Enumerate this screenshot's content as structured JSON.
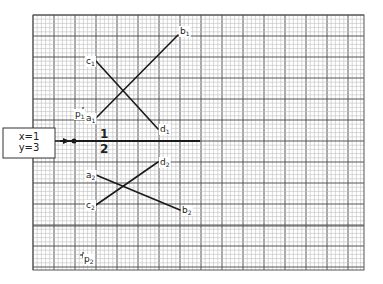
{
  "diagram": {
    "grid": {
      "left": 33,
      "top": 15,
      "right": 364,
      "bottom": 270,
      "minor_step": 4.2,
      "major_every": 5,
      "minor_color": "#bdbdbd",
      "major_color": "#555555",
      "extra_major_y": 226
    },
    "input_box": {
      "lines": [
        "x=1",
        "y=3"
      ],
      "x": 3,
      "y": 128,
      "w": 52,
      "h": 30
    },
    "axis_line": {
      "x1": 60,
      "y1": 141,
      "x2": 200,
      "y2": 141,
      "dot": {
        "x": 74,
        "y": 141
      },
      "label_top": "1",
      "label_bottom": "2",
      "label_x": 100
    },
    "segments": [
      {
        "id": "a1-b1",
        "from": {
          "name": "a",
          "sub": "1",
          "x": 96,
          "y": 118
        },
        "to": {
          "name": "b",
          "sub": "1",
          "x": 178,
          "y": 35
        }
      },
      {
        "id": "c1-d1",
        "from": {
          "name": "c",
          "sub": "1",
          "x": 96,
          "y": 61
        },
        "to": {
          "name": "d",
          "sub": "1",
          "x": 158,
          "y": 129
        }
      },
      {
        "id": "a2-b2",
        "from": {
          "name": "a",
          "sub": "2",
          "x": 96,
          "y": 175
        },
        "to": {
          "name": "b",
          "sub": "2",
          "x": 180,
          "y": 210
        }
      },
      {
        "id": "c2-d2",
        "from": {
          "name": "c",
          "sub": "2",
          "x": 96,
          "y": 205
        },
        "to": {
          "name": "d",
          "sub": "2",
          "x": 158,
          "y": 162
        }
      }
    ],
    "points": [
      {
        "name": "p",
        "sub": "1",
        "x": 83,
        "y": 110
      },
      {
        "name": "p",
        "sub": "2",
        "x": 83,
        "y": 255
      }
    ],
    "labels": {
      "a1": "a1",
      "b1": "b1",
      "c1": "c1",
      "d1": "d1",
      "a2": "a2",
      "b2": "b2",
      "c2": "c2",
      "d2": "d2",
      "p1": "p1",
      "p2": "p2"
    }
  }
}
